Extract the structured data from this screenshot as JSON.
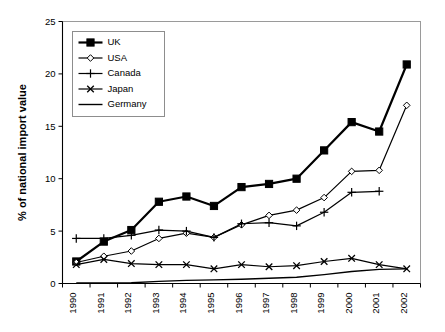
{
  "chart_data": {
    "type": "line",
    "title": "",
    "xlabel": "",
    "ylabel": "% of national import value",
    "ylim": [
      0,
      25
    ],
    "yticks": [
      0,
      5,
      10,
      15,
      20,
      25
    ],
    "grid": false,
    "legend_position": "top-left",
    "categories": [
      "1990",
      "1991",
      "1992",
      "1993",
      "1994",
      "1995",
      "1996",
      "1997",
      "1998",
      "1999",
      "2000",
      "2001",
      "2002"
    ],
    "series": [
      {
        "name": "UK",
        "marker": "filled-square",
        "line_width": 2.2,
        "values": [
          2.1,
          4.0,
          5.1,
          7.8,
          8.3,
          7.4,
          9.2,
          9.5,
          10.0,
          12.7,
          15.4,
          14.5,
          20.9
        ]
      },
      {
        "name": "USA",
        "marker": "open-diamond",
        "line_width": 1.2,
        "values": [
          2.0,
          2.6,
          3.1,
          4.3,
          4.8,
          4.4,
          5.6,
          6.5,
          7.0,
          8.2,
          10.7,
          10.8,
          17.0
        ]
      },
      {
        "name": "Canada",
        "marker": "plus",
        "line_width": 1.2,
        "values": [
          4.3,
          4.3,
          4.6,
          5.1,
          5.0,
          4.4,
          5.7,
          5.8,
          5.5,
          6.8,
          8.7,
          8.8,
          null
        ]
      },
      {
        "name": "Japan",
        "marker": "cross",
        "line_width": 1.2,
        "values": [
          1.8,
          2.3,
          1.9,
          1.8,
          1.8,
          1.4,
          1.8,
          1.6,
          1.7,
          2.1,
          2.4,
          1.8,
          1.4
        ]
      },
      {
        "name": "Germany",
        "marker": "none",
        "line_width": 1.4,
        "values": [
          0.05,
          0.05,
          0.07,
          0.2,
          0.3,
          0.35,
          0.4,
          0.5,
          0.6,
          0.85,
          1.15,
          1.35,
          1.4
        ]
      }
    ]
  },
  "legend": {
    "entries": [
      {
        "label": "UK"
      },
      {
        "label": "USA"
      },
      {
        "label": "Canada"
      },
      {
        "label": "Japan"
      },
      {
        "label": "Germany"
      }
    ]
  },
  "colors": {
    "ink": "#000000",
    "frame": "#9a9a9a",
    "background": "#ffffff"
  }
}
